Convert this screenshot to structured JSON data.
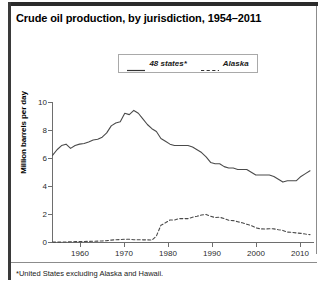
{
  "figure": {
    "title": "Crude oil production, by jurisdiction, 1954–2011",
    "footnote": "*United States excluding Alaska and Hawaii."
  },
  "legend": {
    "position": "top-center",
    "items": [
      {
        "label": "48 states*",
        "style": "solid",
        "icon": "solid-line-icon"
      },
      {
        "label": "Alaska",
        "style": "dashed",
        "icon": "dashed-line-icon"
      }
    ]
  },
  "axes": {
    "y_title": "Million barrels per day",
    "y_ticks": [
      "0",
      "2",
      "4",
      "6",
      "8",
      "10"
    ],
    "x_ticks": [
      "1960",
      "1970",
      "1980",
      "1990",
      "2000",
      "2010"
    ]
  },
  "colors": {
    "line_48states": "#4a4a4a",
    "line_alaska": "#4a4a4a",
    "axis": "#6e6e6e",
    "title_rule": "#2b2b2b",
    "background": "#ffffff"
  },
  "chart_data": {
    "type": "line",
    "title": "Crude oil production, by jurisdiction, 1954–2011",
    "xlabel": "",
    "ylabel": "Million barrels per day",
    "xlim": [
      1954,
      2011
    ],
    "ylim": [
      0,
      10
    ],
    "grid": false,
    "legend_position": "top-center",
    "x": [
      1954,
      1955,
      1956,
      1957,
      1958,
      1959,
      1960,
      1961,
      1962,
      1963,
      1964,
      1965,
      1966,
      1967,
      1968,
      1969,
      1970,
      1971,
      1972,
      1973,
      1974,
      1975,
      1976,
      1977,
      1978,
      1979,
      1980,
      1981,
      1982,
      1983,
      1984,
      1985,
      1986,
      1987,
      1988,
      1989,
      1990,
      1991,
      1992,
      1993,
      1994,
      1995,
      1996,
      1997,
      1998,
      1999,
      2000,
      2001,
      2002,
      2003,
      2004,
      2005,
      2006,
      2007,
      2008,
      2009,
      2010,
      2011
    ],
    "series": [
      {
        "name": "48 states*",
        "style": "solid",
        "values": [
          6.2,
          6.6,
          6.9,
          7.0,
          6.7,
          6.9,
          7.0,
          7.05,
          7.15,
          7.3,
          7.35,
          7.5,
          7.8,
          8.3,
          8.5,
          8.6,
          9.2,
          9.1,
          9.4,
          9.2,
          8.8,
          8.4,
          8.1,
          7.9,
          7.4,
          7.2,
          7.0,
          6.9,
          6.9,
          6.9,
          6.9,
          6.8,
          6.6,
          6.4,
          6.1,
          5.7,
          5.6,
          5.6,
          5.4,
          5.3,
          5.3,
          5.2,
          5.2,
          5.2,
          5.0,
          4.8,
          4.8,
          4.8,
          4.8,
          4.7,
          4.5,
          4.3,
          4.4,
          4.4,
          4.4,
          4.7,
          4.9,
          5.1
        ]
      },
      {
        "name": "Alaska",
        "style": "dashed",
        "values": [
          0.03,
          0.03,
          0.03,
          0.04,
          0.05,
          0.06,
          0.06,
          0.07,
          0.08,
          0.09,
          0.1,
          0.11,
          0.13,
          0.17,
          0.2,
          0.21,
          0.23,
          0.23,
          0.2,
          0.2,
          0.19,
          0.19,
          0.17,
          0.46,
          1.23,
          1.4,
          1.6,
          1.6,
          1.7,
          1.7,
          1.7,
          1.8,
          1.87,
          1.96,
          2.0,
          1.87,
          1.77,
          1.8,
          1.7,
          1.58,
          1.56,
          1.48,
          1.4,
          1.3,
          1.2,
          1.05,
          0.97,
          0.96,
          0.98,
          0.97,
          0.91,
          0.86,
          0.74,
          0.72,
          0.68,
          0.65,
          0.6,
          0.56
        ]
      }
    ]
  }
}
